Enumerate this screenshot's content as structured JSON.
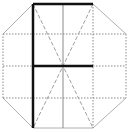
{
  "diagram": {
    "width": 130,
    "height": 132,
    "colors": {
      "background": "#ffffff",
      "outline": "#b0b0b0",
      "grid_dotted": "#8a8a8a",
      "diagonal_dashed": "#a0a0a0",
      "bold_stroke": "#111111"
    },
    "octagon": {
      "points": [
        [
          33,
          4
        ],
        [
          93,
          4
        ],
        [
          126,
          34
        ],
        [
          126,
          98
        ],
        [
          93,
          128
        ],
        [
          33,
          128
        ],
        [
          3,
          98
        ],
        [
          3,
          34
        ]
      ]
    },
    "grid": {
      "vertical_x": [
        33,
        63,
        93
      ],
      "horizontal_y": [
        34,
        66,
        98
      ],
      "x_range": [
        3,
        126
      ],
      "y_range": [
        4,
        128
      ]
    },
    "diagonals": [
      {
        "from": [
          33,
          4
        ],
        "to": [
          93,
          128
        ]
      },
      {
        "from": [
          93,
          4
        ],
        "to": [
          33,
          128
        ]
      }
    ],
    "bold_strokes": [
      {
        "from": [
          33,
          4
        ],
        "to": [
          93,
          4
        ]
      },
      {
        "from": [
          33,
          4
        ],
        "to": [
          33,
          128
        ]
      },
      {
        "from": [
          33,
          66
        ],
        "to": [
          93,
          66
        ]
      }
    ]
  }
}
